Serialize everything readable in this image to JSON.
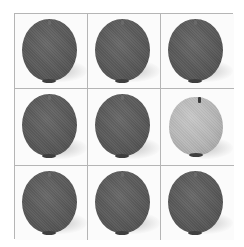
{
  "puzzle": {
    "type": "odd-one-out grid",
    "rows": 3,
    "columns": 3,
    "cells": [
      {
        "row": 0,
        "col": 0,
        "object": "dark-apple"
      },
      {
        "row": 0,
        "col": 1,
        "object": "dark-apple"
      },
      {
        "row": 0,
        "col": 2,
        "object": "dark-apple"
      },
      {
        "row": 1,
        "col": 0,
        "object": "dark-apple"
      },
      {
        "row": 1,
        "col": 1,
        "object": "dark-apple"
      },
      {
        "row": 1,
        "col": 2,
        "object": "light-apple"
      },
      {
        "row": 2,
        "col": 0,
        "object": "dark-apple"
      },
      {
        "row": 2,
        "col": 1,
        "object": "dark-apple"
      },
      {
        "row": 2,
        "col": 2,
        "object": "dark-apple"
      }
    ],
    "colors": {
      "grid_line": "#b5b5b5",
      "background": "#fbfbfb",
      "dark_apple": "#5a5a5a",
      "light_apple": "#b6b6b6"
    }
  }
}
